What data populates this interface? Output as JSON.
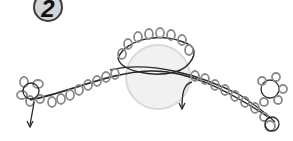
{
  "step": {
    "number": "2"
  },
  "diagram": {
    "colors": {
      "thread": "#2a2a2a",
      "picot": "#8a8a8a",
      "ring_fill": "#eeeeee",
      "ring_stroke": "#d8d8d8",
      "badge_fill": "#d4d4d4"
    }
  }
}
